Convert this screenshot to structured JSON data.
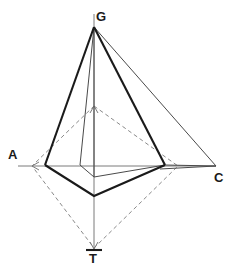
{
  "figure": {
    "type": "geometric-line-diagram",
    "background_color": "#ffffff",
    "canvas": {
      "width": 238,
      "height": 276
    },
    "vertices": [
      {
        "id": "G",
        "label": "G",
        "role": "top-apex",
        "point": [
          94,
          27
        ],
        "label_point": [
          98,
          16
        ]
      },
      {
        "id": "A",
        "label": "A",
        "role": "left-axis-end",
        "point": [
          18,
          166
        ],
        "label_point": [
          13,
          154
        ]
      },
      {
        "id": "C",
        "label": "C",
        "role": "right-axis-end",
        "point": [
          216,
          166
        ],
        "label_point": [
          218,
          178
        ]
      },
      {
        "id": "T",
        "label": "T",
        "role": "bottom-axis-end",
        "point": [
          94,
          250
        ],
        "label_point": [
          94,
          259
        ]
      }
    ],
    "axes": {
      "horizontal": {
        "from": [
          18,
          166
        ],
        "to": [
          216,
          166
        ],
        "color": "#7a7a7a"
      },
      "vertical": {
        "from": [
          94,
          14
        ],
        "to": [
          94,
          250
        ],
        "color": "#7a7a7a"
      }
    },
    "outline_triangle": {
      "stroke": "#1a1a1a",
      "weight": "bold",
      "points": [
        [
          94,
          27
        ],
        [
          45,
          165
        ],
        [
          165,
          165
        ]
      ]
    },
    "thin_triangle": {
      "stroke": "#4a4a4a",
      "weight": "thin",
      "points": [
        [
          94,
          27
        ],
        [
          216,
          166
        ],
        [
          165,
          165
        ]
      ]
    },
    "dashed_diamond": {
      "stroke": "#8a8a8a",
      "weight": "dashed",
      "points": [
        [
          94,
          106
        ],
        [
          178,
          166
        ],
        [
          94,
          248
        ],
        [
          32,
          166
        ]
      ]
    },
    "bold_polygon": {
      "stroke": "#1a1a1a",
      "weight": "bold",
      "points": [
        [
          45,
          165
        ],
        [
          94,
          196
        ],
        [
          165,
          165
        ]
      ]
    },
    "thin_inner_polygon": {
      "stroke": "#4a4a4a",
      "weight": "thin",
      "points": [
        [
          80,
          165
        ],
        [
          94,
          177
        ],
        [
          165,
          165
        ]
      ]
    },
    "thin_inner_edges": [
      {
        "from": [
          94,
          27
        ],
        "to": [
          80,
          165
        ]
      },
      {
        "from": [
          94,
          27
        ],
        "to": [
          94,
          177
        ]
      }
    ],
    "arrowheads": [
      {
        "at": [
          32,
          166
        ],
        "direction": "left"
      },
      {
        "at": [
          94,
          248
        ],
        "direction": "down"
      },
      {
        "at": [
          94,
          106
        ],
        "direction": "up"
      }
    ],
    "colors": {
      "bold_stroke": "#1a1a1a",
      "thin_stroke": "#4a4a4a",
      "dashed_stroke": "#8a8a8a",
      "axis_stroke": "#7a7a7a",
      "label_text": "#1a1a1a",
      "background": "#ffffff"
    }
  }
}
